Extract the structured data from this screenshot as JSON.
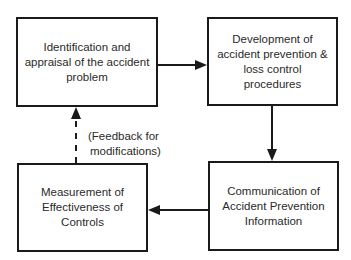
{
  "diagram": {
    "type": "flowchart-cycle",
    "nodes": [
      {
        "id": "identification",
        "text": "Identification and appraisal of the accident problem"
      },
      {
        "id": "development",
        "text": "Development of accident prevention & loss control procedures"
      },
      {
        "id": "measurement",
        "text": "Measurement of Effectiveness of Controls"
      },
      {
        "id": "communication",
        "text": "Communication of Accident Prevention Information"
      }
    ],
    "edges": [
      {
        "from": "identification",
        "to": "development",
        "style": "solid"
      },
      {
        "from": "development",
        "to": "communication",
        "style": "solid"
      },
      {
        "from": "communication",
        "to": "measurement",
        "style": "solid"
      },
      {
        "from": "measurement",
        "to": "identification",
        "style": "dashed",
        "label": "(Feedback for modifications)"
      }
    ],
    "feedback_label_line1": "(Feedback for",
    "feedback_label_line2": "modifications)",
    "colors": {
      "line": "#1a1a1a",
      "text": "#2a2a2a",
      "background": "#ffffff"
    }
  }
}
